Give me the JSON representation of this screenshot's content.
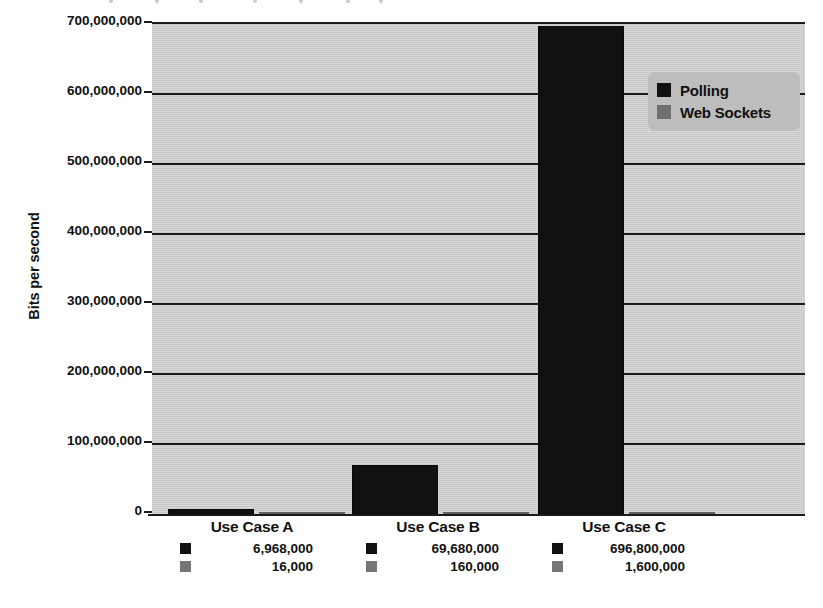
{
  "chart_data": {
    "type": "bar",
    "title": "",
    "xlabel": "",
    "ylabel": "Bits per second",
    "ylim": [
      0,
      700000000
    ],
    "grid": true,
    "legend_position": "top-right",
    "categories": [
      "Use Case A",
      "Use Case B",
      "Use Case C"
    ],
    "ytick_labels": [
      "700,000,000",
      "600,000,000",
      "500,000,000",
      "400,000,000",
      "300,000,000",
      "200,000,000",
      "100,000,000",
      "0"
    ],
    "ytick_values": [
      700000000,
      600000000,
      500000000,
      400000000,
      300000000,
      200000000,
      100000000,
      0
    ],
    "series": [
      {
        "name": "Polling",
        "color": "#111111",
        "values": [
          6968000,
          69680000,
          696800000
        ],
        "value_labels": [
          "6,968,000",
          "69,680,000",
          "696,800,000"
        ]
      },
      {
        "name": "Web Sockets",
        "color": "#6e6e6e",
        "values": [
          16000,
          160000,
          1600000
        ],
        "value_labels": [
          "16,000",
          "160,000",
          "1,600,000"
        ]
      }
    ]
  },
  "legend": {
    "items": [
      {
        "label": "Polling",
        "swatch": "polling"
      },
      {
        "label": "Web Sockets",
        "swatch": "websockets"
      }
    ]
  },
  "colors": {
    "polling": "#111111",
    "websockets": "#6e6e6e",
    "plot_background": "#cfcfcf",
    "legend_background": "#bdbdbd",
    "axis": "#1a1a1a"
  }
}
